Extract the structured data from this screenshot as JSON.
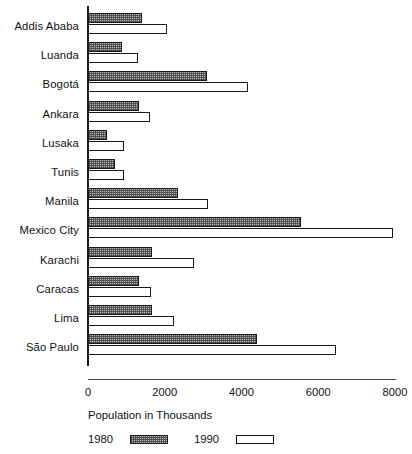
{
  "chart_data": {
    "type": "bar",
    "orientation": "horizontal",
    "title": "",
    "xlabel": "Population in Thousands",
    "ylabel": "",
    "xlim": [
      0,
      8000
    ],
    "xticks": [
      0,
      2000,
      4000,
      6000,
      8000
    ],
    "xtick_labels": [
      "0",
      "2000",
      "4000",
      "6000",
      "8000"
    ],
    "grid": false,
    "legend_position": "bottom-left",
    "categories": [
      "Addis Ababa",
      "Luanda",
      "Bogotá",
      "Ankara",
      "Lusaka",
      "Tunis",
      "Manila",
      "Mexico City",
      "Karachi",
      "Caracas",
      "Lima",
      "São Paulo"
    ],
    "series": [
      {
        "name": "1980",
        "fill": "hatched-grey",
        "color": "#b9b9b9",
        "values": [
          1400,
          880,
          3100,
          1340,
          490,
          700,
          2350,
          5560,
          1670,
          1330,
          1670,
          4400
        ]
      },
      {
        "name": "1990",
        "fill": "white",
        "color": "#ffffff",
        "values": [
          2060,
          1290,
          4180,
          1620,
          930,
          930,
          3120,
          7960,
          2760,
          1640,
          2240,
          6450
        ]
      }
    ]
  },
  "axis": {
    "title": "Population in Thousands"
  },
  "legend": {
    "items": [
      {
        "label": "1980"
      },
      {
        "label": "1990"
      }
    ]
  },
  "colors": {
    "axis": "#1a1a1a",
    "bar_1980": "#b9b9b9",
    "bar_1990": "#ffffff",
    "text": "#111111"
  }
}
